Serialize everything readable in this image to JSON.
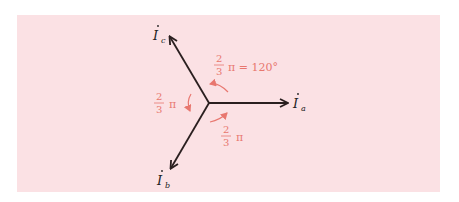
{
  "colors": {
    "background": "#fbe1e4",
    "phasor": "#2a1f1f",
    "angle": "#e8776f"
  },
  "phasors": [
    {
      "name": "I",
      "subscript": "a",
      "direction_deg": 0
    },
    {
      "name": "I",
      "subscript": "b",
      "direction_deg": 240
    },
    {
      "name": "I",
      "subscript": "c",
      "direction_deg": 120
    }
  ],
  "angles": {
    "top": {
      "num": "2",
      "den": "3",
      "suffix": "π = 120°"
    },
    "left": {
      "num": "2",
      "den": "3",
      "suffix": "π"
    },
    "bottom": {
      "num": "2",
      "den": "3",
      "suffix": "π"
    }
  }
}
